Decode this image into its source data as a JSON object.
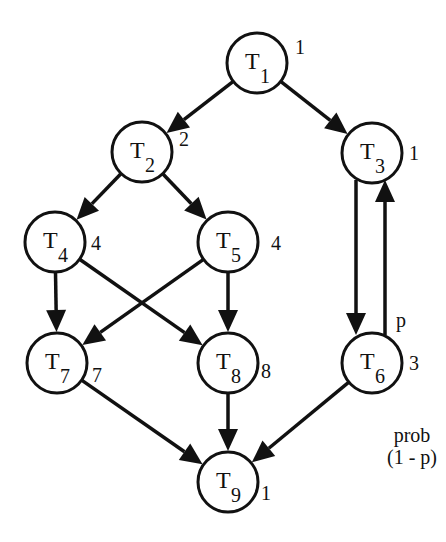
{
  "diagram": {
    "type": "task-graph",
    "node_radius": 30,
    "stroke_color": "#111111",
    "background": "#ffffff",
    "nodes": [
      {
        "id": "T1",
        "label": "T",
        "sub": "1",
        "weight": "1",
        "x": 257,
        "y": 63,
        "wx": 300,
        "wy": 54
      },
      {
        "id": "T2",
        "label": "T",
        "sub": "2",
        "weight": "2",
        "x": 142,
        "y": 152,
        "wx": 184,
        "wy": 146
      },
      {
        "id": "T3",
        "label": "T",
        "sub": "3",
        "weight": "1",
        "x": 372,
        "y": 153,
        "wx": 414,
        "wy": 160
      },
      {
        "id": "T4",
        "label": "T",
        "sub": "4",
        "weight": "4",
        "x": 55,
        "y": 242,
        "wx": 96,
        "wy": 250
      },
      {
        "id": "T5",
        "label": "T",
        "sub": "5",
        "weight": "4",
        "x": 228,
        "y": 242,
        "wx": 276,
        "wy": 250
      },
      {
        "id": "T6",
        "label": "T",
        "sub": "6",
        "weight": "3",
        "x": 372,
        "y": 363,
        "wx": 414,
        "wy": 370
      },
      {
        "id": "T7",
        "label": "T",
        "sub": "7",
        "weight": "7",
        "x": 57,
        "y": 363,
        "wx": 97,
        "wy": 382
      },
      {
        "id": "T8",
        "label": "T",
        "sub": "8",
        "weight": "8",
        "x": 228,
        "y": 363,
        "wx": 266,
        "wy": 378
      },
      {
        "id": "T9",
        "label": "T",
        "sub": "9",
        "weight": "1",
        "x": 228,
        "y": 482,
        "wx": 266,
        "wy": 500
      }
    ],
    "edges": [
      {
        "from": "T1",
        "to": "T2"
      },
      {
        "from": "T1",
        "to": "T3"
      },
      {
        "from": "T2",
        "to": "T4"
      },
      {
        "from": "T2",
        "to": "T5"
      },
      {
        "from": "T4",
        "to": "T7"
      },
      {
        "from": "T4",
        "to": "T8"
      },
      {
        "from": "T5",
        "to": "T7"
      },
      {
        "from": "T5",
        "to": "T8"
      },
      {
        "from": "T7",
        "to": "T9"
      },
      {
        "from": "T8",
        "to": "T9"
      },
      {
        "from": "T6",
        "to": "T9",
        "label": "prob",
        "label2": "(1 - p)",
        "lx": 412,
        "ly": 442
      },
      {
        "from": "T3",
        "to": "T6",
        "straight": true,
        "x1": 356,
        "y1": 180,
        "x2": 356,
        "y2": 335
      },
      {
        "from": "T6",
        "to": "T3",
        "straight": true,
        "x1": 385,
        "y1": 335,
        "x2": 385,
        "y2": 180,
        "label": "p",
        "lx": 396,
        "ly": 327
      }
    ]
  }
}
